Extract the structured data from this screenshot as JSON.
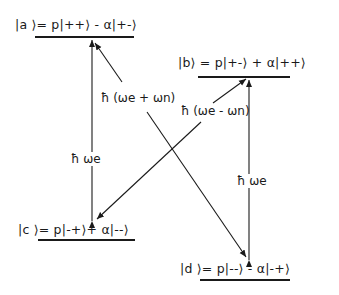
{
  "states": {
    "a": {
      "label": "|a ⟩=  p|++⟩ -  α|+-⟩"
    },
    "b": {
      "label": "|b⟩ = p|+-⟩ + α|++⟩"
    },
    "c": {
      "label": "|c ⟩= p|-+⟩+  α|--⟩"
    },
    "d": {
      "label": "|d ⟩= p|--⟩ -  α|-+⟩"
    }
  },
  "transitions": {
    "a_c": {
      "label": "ħ ωe",
      "from": "c",
      "to": "a",
      "bidirectional": true
    },
    "b_d": {
      "label": "ħ ωe",
      "from": "d",
      "to": "b",
      "bidirectional": true
    },
    "a_d": {
      "label": "ħ (ωe + ωn)",
      "from": "d",
      "to": "a",
      "bidirectional": true
    },
    "b_c": {
      "label": "ħ (ωe - ωn)",
      "from": "c",
      "to": "b",
      "bidirectional": true
    }
  },
  "colors": {
    "line": "#1a1a1a",
    "background": "#ffffff"
  }
}
